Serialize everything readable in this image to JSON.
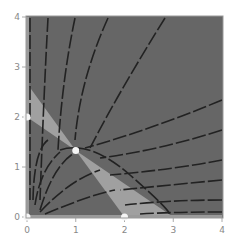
{
  "chart_data": {
    "type": "line",
    "title": "",
    "xlabel": "",
    "ylabel": "",
    "xlim": [
      0,
      4
    ],
    "ylim": [
      0,
      4
    ],
    "grid": false,
    "x_ticks": [
      "0",
      "1",
      "2",
      "3",
      "4"
    ],
    "y_ticks": [
      "0",
      "1",
      "2",
      "3",
      "4"
    ],
    "background_color": "#666666",
    "region_color": "#a0a0a0",
    "trajectory_color": "#222222",
    "point_color": "#f5f5f5",
    "nullclines": [
      {
        "name": "nullcline-a",
        "points": [
          [
            0,
            2
          ],
          [
            3,
            0
          ]
        ]
      },
      {
        "name": "nullcline-b",
        "points": [
          [
            0,
            2.67
          ],
          [
            2,
            0
          ]
        ]
      }
    ],
    "equilibria": [
      {
        "x": 0,
        "y": 0
      },
      {
        "x": 0,
        "y": 2
      },
      {
        "x": 2,
        "y": 0
      },
      {
        "x": 1,
        "y": 1.33
      }
    ]
  }
}
